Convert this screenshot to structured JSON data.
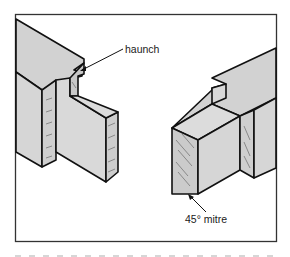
{
  "figure": {
    "type": "technical-illustration",
    "frame": {
      "stroke": "#333333",
      "fill": "#ffffff"
    },
    "colors": {
      "timber_face": "#d4d4d4",
      "timber_end": "#c8c8c8",
      "outline": "#111111",
      "grain": "#7a7a7a"
    },
    "parts": [
      {
        "id": "left-member",
        "description": "stile with haunched mortise"
      },
      {
        "id": "right-member",
        "description": "rail with tenon cut at 45° mitre"
      }
    ]
  },
  "labels": {
    "haunch": "haunch",
    "mitre": "45° mitre"
  },
  "caption": {
    "visible_text": ""
  }
}
